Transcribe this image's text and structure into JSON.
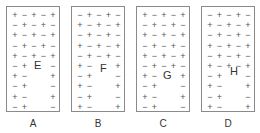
{
  "diagram": {
    "panels": [
      {
        "label": "A",
        "point_label": "E",
        "rows": [
          [
            "+",
            "−",
            "+",
            "−",
            "+"
          ],
          [
            "−",
            "+",
            "−",
            "+",
            "−"
          ],
          [
            "+",
            "−",
            "+",
            "−",
            "+"
          ],
          [
            "−",
            "+",
            "−",
            "+",
            "−"
          ],
          [
            "+",
            "−",
            "+",
            "−",
            "+"
          ],
          [
            "−",
            "+",
            "",
            "",
            "−"
          ],
          [
            "+",
            "−",
            "",
            "",
            "+"
          ],
          [
            "−",
            "+",
            "",
            "",
            "−"
          ],
          [
            "+",
            "−",
            "",
            "",
            "+"
          ],
          [
            "−",
            "+",
            "",
            "",
            "−"
          ]
        ]
      },
      {
        "label": "B",
        "point_label": "F",
        "rows": [
          [
            "−",
            "+",
            "−",
            "+",
            "−"
          ],
          [
            "+",
            "−",
            "+",
            "−",
            "+"
          ],
          [
            "−",
            "+",
            "−",
            "+",
            "−"
          ],
          [
            "+",
            "−",
            "+",
            "−",
            "+"
          ],
          [
            "−",
            "+",
            "−",
            "+",
            "−"
          ],
          [
            "+",
            "−",
            "",
            "",
            "+"
          ],
          [
            "−",
            "+",
            "",
            "",
            "−"
          ],
          [
            "+",
            "−",
            "",
            "",
            "+"
          ],
          [
            "−",
            "+",
            "",
            "",
            "−"
          ],
          [
            "+",
            "−",
            "",
            "",
            "+"
          ]
        ]
      },
      {
        "label": "C",
        "point_label": "G",
        "rows": [
          [
            "+",
            "−",
            "+",
            "−",
            "+"
          ],
          [
            "−",
            "+",
            "−",
            "+",
            "−"
          ],
          [
            "+",
            "−",
            "+",
            "−",
            "+"
          ],
          [
            "−",
            "+",
            "−",
            "+",
            "−"
          ],
          [
            "+",
            "−",
            "+",
            "−",
            "+"
          ],
          [
            "−",
            "+",
            "−",
            "+",
            "−"
          ],
          [
            "+",
            "−",
            "",
            "",
            "+"
          ],
          [
            "−",
            "+",
            "",
            "",
            "−"
          ],
          [
            "+",
            "−",
            "",
            "",
            "+"
          ],
          [
            "−",
            "+",
            "",
            "",
            "−"
          ]
        ]
      },
      {
        "label": "D",
        "point_label": "H",
        "rows": [
          [
            "−",
            "+",
            "−",
            "+",
            "−"
          ],
          [
            "+",
            "−",
            "+",
            "−",
            "+"
          ],
          [
            "−",
            "+",
            "−",
            "+",
            "−"
          ],
          [
            "+",
            "−",
            "+",
            "−",
            "+"
          ],
          [
            "−",
            "+",
            "−",
            "+",
            "−"
          ],
          [
            "+",
            "−",
            "+",
            "−",
            "+"
          ],
          [
            "−",
            "+",
            "",
            "",
            "−"
          ],
          [
            "+",
            "−",
            "",
            "",
            "+"
          ],
          [
            "−",
            "+",
            "",
            "",
            "−"
          ],
          [
            "+",
            "−",
            "",
            "",
            "+"
          ]
        ]
      }
    ]
  }
}
